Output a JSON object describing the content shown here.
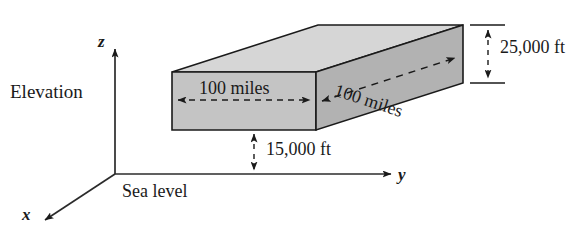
{
  "figure": {
    "background_color": "#ffffff",
    "line_color": "#1a1a1a"
  },
  "axes": {
    "vertical_label": "z",
    "depth_label": "x",
    "horizontal_label": "y",
    "elevation_label": "Elevation",
    "baseline_label": "Sea level"
  },
  "box": {
    "front_width_label": "100 miles",
    "depth_label": "100 miles",
    "height_label": "25,000 ft",
    "base_altitude_label": "15,000 ft",
    "face_colors": {
      "top": "#d4d4d4",
      "front": "#c2c2c2",
      "right": "#b0b0b0"
    }
  }
}
